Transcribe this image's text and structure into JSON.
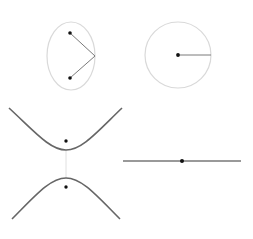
{
  "diagram": {
    "title": "",
    "colors": {
      "background": "#ffffff",
      "outline": "#d9d9d9",
      "segment": "#7a7a7a",
      "curve": "#666666",
      "point": "#111111",
      "axis_segment": "#e0e0e0"
    },
    "panels": [
      {
        "name": "ellipse",
        "center": [
          71,
          56
        ],
        "rx": 24,
        "ry": 34,
        "foci": [
          [
            70,
            33
          ],
          [
            70,
            78
          ]
        ],
        "vertex": [
          95,
          56
        ]
      },
      {
        "name": "circle",
        "center": [
          178,
          55
        ],
        "r": 33,
        "radius_end": [
          211,
          55
        ]
      },
      {
        "name": "hyperbola",
        "center_x": 66,
        "upper_vertex_y": 150,
        "lower_vertex_y": 178,
        "foci": [
          [
            66,
            141
          ],
          [
            66,
            187
          ]
        ]
      },
      {
        "name": "line",
        "start": [
          123,
          161
        ],
        "end": [
          241,
          161
        ],
        "point": [
          182,
          161
        ]
      }
    ]
  }
}
